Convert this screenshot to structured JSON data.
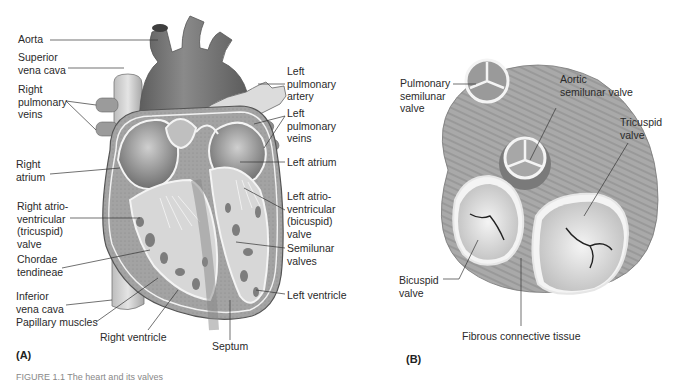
{
  "figure": {
    "panels": [
      {
        "tag": "(A)",
        "subject": "Heart, frontal section",
        "labels_left": [
          {
            "text": "Aorta"
          },
          {
            "text": "Superior\nvena cava"
          },
          {
            "text": "Right\npulmonary\nveins"
          },
          {
            "text": "Right\natrium"
          },
          {
            "text": "Right atrio-\nventricular\n(tricuspid)\nvalve"
          },
          {
            "text": "Chordae\ntendineae"
          },
          {
            "text": "Inferior\nvena cava"
          },
          {
            "text": "Papillary muscles"
          }
        ],
        "labels_bottom": [
          {
            "text": "Right ventricle"
          },
          {
            "text": "Septum"
          }
        ],
        "labels_right": [
          {
            "text": "Left\npulmonary\nartery"
          },
          {
            "text": "Left\npulmonary\nveins"
          },
          {
            "text": "Left atrium"
          },
          {
            "text": "Left atrio-\nventricular\n(bicuspid)\nvalve"
          },
          {
            "text": "Semilunar\nvalves"
          },
          {
            "text": "Left ventricle"
          }
        ]
      },
      {
        "tag": "(B)",
        "subject": "Heart valves, superior view",
        "labels": [
          {
            "text": "Pulmonary\nsemilunar\nvalve"
          },
          {
            "text": "Aortic\nsemilunar valve"
          },
          {
            "text": "Tricuspid\nvalve"
          },
          {
            "text": "Bicuspid\nvalve"
          },
          {
            "text": "Fibrous connective tissue"
          }
        ]
      }
    ],
    "caption_partial": "FIGURE 1.1  The heart and its valves"
  },
  "colors": {
    "ink": "#2a2a2a",
    "aorta": "#6e6e6e",
    "muscle": "#9a9a9a",
    "light": "#d9d9d9",
    "cavity": "#e8e8e8"
  }
}
